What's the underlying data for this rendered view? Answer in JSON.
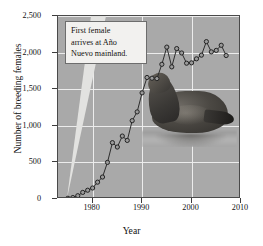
{
  "chart_data": {
    "type": "line",
    "title": "",
    "xlabel": "Year",
    "ylabel": "Number of breeding females",
    "xlim": [
      1973,
      2010
    ],
    "ylim": [
      0,
      2500
    ],
    "xticks": [
      1980,
      1990,
      2000,
      2010
    ],
    "yticks": [
      0,
      500,
      1000,
      1500,
      2000,
      2500
    ],
    "ytick_labels": [
      "0",
      "500",
      "1,000",
      "1,500",
      "2,000",
      "2,500"
    ],
    "xtick_labels": [
      "1980",
      "1990",
      "2000",
      "2010"
    ],
    "grid": true,
    "legend": "none",
    "marker": "open-circle",
    "series": [
      {
        "name": "Breeding females at Año Nuevo mainland",
        "x": [
          1975,
          1976,
          1977,
          1978,
          1979,
          1980,
          1981,
          1982,
          1983,
          1984,
          1985,
          1986,
          1987,
          1988,
          1989,
          1990,
          1991,
          1992,
          1993,
          1994,
          1995,
          1996,
          1997,
          1998,
          1999,
          2000,
          2001,
          2002,
          2003,
          2004,
          2005,
          2006,
          2007
        ],
        "values": [
          10,
          20,
          45,
          90,
          120,
          150,
          230,
          300,
          500,
          770,
          710,
          860,
          800,
          1070,
          1190,
          1450,
          1660,
          1650,
          1645,
          1840,
          2075,
          1805,
          2055,
          1995,
          1855,
          1860,
          1915,
          1965,
          2150,
          2010,
          2030,
          2100,
          1960
        ]
      }
    ],
    "annotations": [
      {
        "name": "first-female-callout",
        "text": "First female arrives at Año Nuevo mainland.",
        "lines": [
          "First female",
          "arrives at Año",
          "Nuevo mainland."
        ],
        "points_to_x": 1975,
        "points_to_y": 0
      }
    ],
    "image_overlay": {
      "name": "sea-lion-photo",
      "description": "Photograph of a northern elephant seal at the water's edge"
    },
    "colors": {
      "plot_background": "#a9a9a9",
      "grid": "#efefef",
      "line": "#2d2d2d",
      "marker_fill": "#9a9a9a",
      "marker_edge": "#232323",
      "callout_background": "#f2f1ef",
      "callout_border": "#6d6d6d",
      "leader": "#e2e2e0",
      "axis": "#3d3d3d",
      "page_background": "#ffffff"
    }
  }
}
